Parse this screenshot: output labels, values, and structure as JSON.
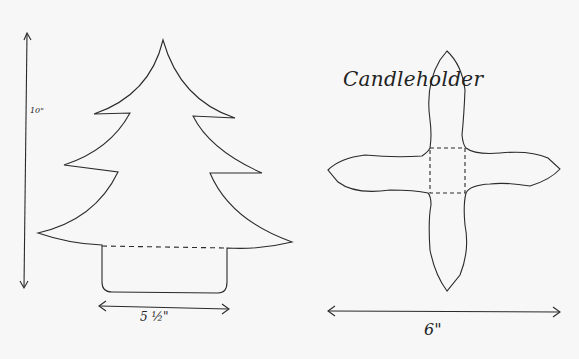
{
  "tree": {
    "name": "Christmas tree pattern",
    "height_label": "10\"",
    "width_label": "5 ½\""
  },
  "candleholder": {
    "title": "Candleholder",
    "width_label": "6\""
  },
  "colors": {
    "ink": "#2a2a2a",
    "paper": "#f7f7f7"
  }
}
